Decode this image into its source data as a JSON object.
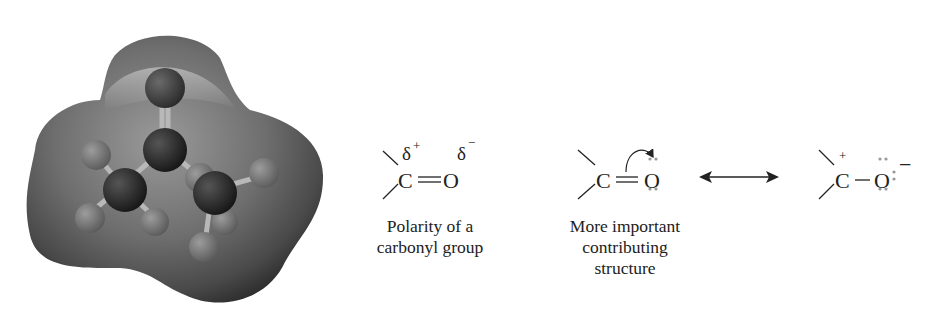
{
  "figure": {
    "model": {
      "label": "electrostatic-potential-map-acetone"
    },
    "polarity": {
      "carbon": "C",
      "oxygen": "O",
      "delta_plus": "δ",
      "delta_plus_sign": "+",
      "delta_minus": "δ",
      "delta_minus_sign": "−",
      "caption_line1": "Polarity of a",
      "caption_line2": "carbonyl group"
    },
    "contributor1": {
      "carbon": "C",
      "oxygen": "O",
      "caption_line1": "More important",
      "caption_line2": "contributing",
      "caption_line3": "structure"
    },
    "resonance_arrow": {
      "label": "double-headed-arrow"
    },
    "contributor2": {
      "carbon": "C",
      "carbon_charge": "+",
      "oxygen": "O",
      "oxygen_charge": "−"
    }
  }
}
